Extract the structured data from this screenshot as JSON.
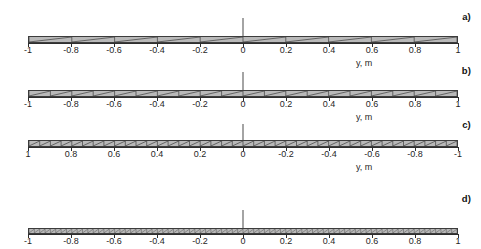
{
  "figure": {
    "background_color": "#ffffff",
    "line_color": "#2e2e2e",
    "fill_color": "#b9b9b9"
  },
  "chart_data": {
    "type": "diagram",
    "title": "",
    "xlabel": "y, m",
    "ylabel": "",
    "xlim": [
      -1,
      1
    ],
    "grid": false,
    "legend": null,
    "panels": [
      {
        "letter": "a)",
        "axis_caption": "y, m",
        "reversed": false,
        "cells": 10,
        "tick_values": [
          -1,
          -0.8,
          -0.6,
          -0.4,
          -0.2,
          0,
          0.2,
          0.4,
          0.6,
          0.8,
          1
        ],
        "tick_labels": [
          "-1",
          "-0.8",
          "-0.6",
          "-0.4",
          "-0.2",
          "0",
          "0.2",
          "0.4",
          "0.6",
          "0.8",
          "1"
        ]
      },
      {
        "letter": "b)",
        "axis_caption": "y, m",
        "reversed": false,
        "cells": 20,
        "tick_values": [
          -1,
          -0.8,
          -0.6,
          -0.4,
          -0.2,
          0,
          0.2,
          0.4,
          0.6,
          0.8,
          1
        ],
        "tick_labels": [
          "-1",
          "-0.8",
          "-0.6",
          "-0.4",
          "-0.2",
          "0",
          "0.2",
          "0.4",
          "0.6",
          "0.8",
          "1"
        ]
      },
      {
        "letter": "c)",
        "axis_caption": "y, m",
        "reversed": true,
        "cells": 40,
        "tick_values": [
          1,
          0.8,
          0.6,
          0.4,
          0.2,
          0,
          -0.2,
          -0.4,
          -0.6,
          -0.8,
          -1
        ],
        "tick_labels": [
          "1",
          "0.8",
          "0.6",
          "0.4",
          "0.2",
          "0",
          "-0.2",
          "-0.4",
          "-0.6",
          "-0.8",
          "-1"
        ]
      },
      {
        "letter": "d)",
        "axis_caption": "y, m",
        "reversed": false,
        "cells": 80,
        "tick_values": [
          -1,
          -0.8,
          -0.6,
          -0.4,
          -0.2,
          0,
          0.2,
          0.4,
          0.6,
          0.8,
          1
        ],
        "tick_labels": [
          "-1",
          "-0.8",
          "-0.6",
          "-0.4",
          "-0.2",
          "0",
          "0.2",
          "0.4",
          "0.6",
          "0.8",
          "1"
        ]
      }
    ]
  }
}
